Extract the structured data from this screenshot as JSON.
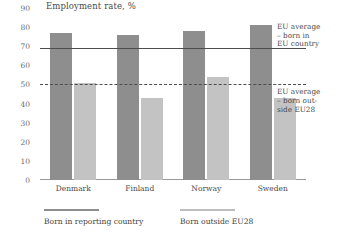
{
  "chart_data": {
    "type": "bar",
    "title": "Employment rate, %",
    "xlabel": "",
    "ylabel": "",
    "ylim": [
      0,
      90
    ],
    "yticks": [
      90,
      80,
      70,
      60,
      50,
      40,
      30,
      20,
      10,
      0
    ],
    "grid": false,
    "legend_position": "bottom",
    "categories": [
      "Denmark",
      "Finland",
      "Norway",
      "Sweden"
    ],
    "series": [
      {
        "name": "Born in reporting country",
        "color": "#8e8e8e",
        "values": [
          77,
          76,
          78,
          81
        ]
      },
      {
        "name": "Born outside EU28",
        "color": "#c3c3c3",
        "values": [
          51,
          43,
          54,
          43
        ]
      }
    ],
    "reference_lines": [
      {
        "name": "eu-average-born-in-eu",
        "value": 69,
        "style": "solid",
        "label": "EU average\n– born in\nEU country"
      },
      {
        "name": "eu-average-born-outside-eu28",
        "value": 50,
        "style": "dashed",
        "label": "EU average\n– born out-\nside EU28"
      }
    ]
  },
  "legend": [
    {
      "label": "Born in reporting country",
      "color": "#8e8e8e"
    },
    {
      "label": "Born outside EU28",
      "color": "#bdbdbd"
    }
  ]
}
